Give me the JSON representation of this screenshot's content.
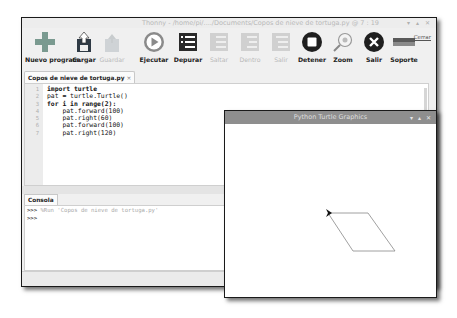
{
  "main_window": {
    "title": "Thonny - /home/pi/..../Documents/Copos de nieve de tortuga.py @ 7 : 19",
    "window_buttons": [
      "minimize",
      "maximize",
      "close"
    ],
    "toolbar": [
      {
        "label": "Nuevo program.",
        "icon": "new-file-plus-icon",
        "enabled": true
      },
      {
        "label": "Cargar",
        "icon": "load-icon",
        "enabled": true
      },
      {
        "label": "Guardar",
        "icon": "save-icon",
        "enabled": false
      },
      {
        "label": "Ejecutar",
        "icon": "run-play-icon",
        "enabled": true
      },
      {
        "label": "Depurar",
        "icon": "debug-icon",
        "enabled": true
      },
      {
        "label": "Saltar",
        "icon": "step-over-icon",
        "enabled": false
      },
      {
        "label": "Dentro",
        "icon": "step-into-icon",
        "enabled": false
      },
      {
        "label": "Salir",
        "icon": "step-out-icon",
        "enabled": false
      },
      {
        "label": "Detener",
        "icon": "stop-icon",
        "enabled": true
      },
      {
        "label": "Zoom",
        "icon": "zoom-icon",
        "enabled": true
      },
      {
        "label": "Salir",
        "icon": "quit-x-icon",
        "enabled": true
      },
      {
        "label": "Soporte",
        "icon": "support-flag-icon",
        "enabled": true
      }
    ],
    "extra_link": "Cerrar",
    "editor_tab": {
      "label": "Copos de nieve de tortuga.py",
      "close": "×"
    },
    "code_lines": [
      {
        "n": "1",
        "text": "import turtle"
      },
      {
        "n": "2",
        "text": "pat = turtle.Turtle()"
      },
      {
        "n": "3",
        "text": "for i in range(2):"
      },
      {
        "n": "4",
        "text": "    pat.forward(100)"
      },
      {
        "n": "5",
        "text": "    pat.right(60)"
      },
      {
        "n": "6",
        "text": "    pat.forward(100)"
      },
      {
        "n": "7",
        "text": "    pat.right(120)"
      }
    ],
    "console_tab": "Consola",
    "console_lines": [
      {
        "prompt": ">>>",
        "text": " %Run 'Copos de nieve de tortuga.py'"
      },
      {
        "prompt": ">>>",
        "text": ""
      }
    ]
  },
  "turtle_window": {
    "title": "Python Turtle Graphics",
    "window_buttons": [
      "minimize",
      "maximize",
      "close"
    ],
    "drawing": {
      "shape": "parallelogram",
      "stroke_color": "#888888",
      "points": [
        [
          103,
          89
        ],
        [
          143,
          89
        ],
        [
          170,
          127
        ],
        [
          128,
          127
        ]
      ],
      "turtle_cursor": [
        103,
        89
      ]
    }
  }
}
